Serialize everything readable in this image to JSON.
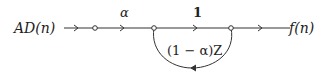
{
  "diagram": {
    "type": "signal-flow-graph",
    "input_label": "AD(n)",
    "output_label": "f(n)",
    "branches": [
      {
        "from": "input",
        "to": "node1",
        "gain": ""
      },
      {
        "from": "node1",
        "to": "node2",
        "gain": "α"
      },
      {
        "from": "node2",
        "to": "node3",
        "gain": "1"
      },
      {
        "from": "node3",
        "to": "output",
        "gain": ""
      },
      {
        "from": "node3",
        "to": "node2",
        "gain": "(1 − α)Z",
        "style": "feedback-loop"
      }
    ],
    "labels": {
      "alpha": "α",
      "one": "1",
      "feedback": "(1 − α)Z"
    },
    "colors": {
      "line": "#333333",
      "text": "#222222",
      "background": "#ffffff"
    }
  }
}
